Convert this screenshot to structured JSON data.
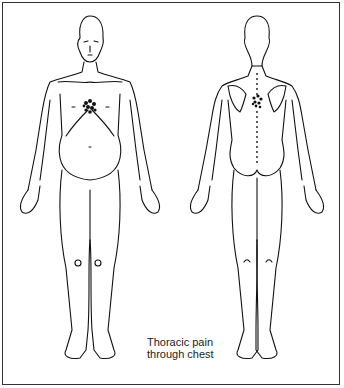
{
  "diagram": {
    "type": "anatomical-body-chart",
    "views": [
      {
        "name": "front",
        "pain_region": "center of chest (sternum)"
      },
      {
        "name": "back",
        "pain_region": "upper thoracic spine between shoulder blades"
      }
    ],
    "caption": {
      "line1": "Thoracic pain",
      "line2": "through chest"
    },
    "colors": {
      "line": "#111111",
      "background": "#ffffff"
    }
  }
}
